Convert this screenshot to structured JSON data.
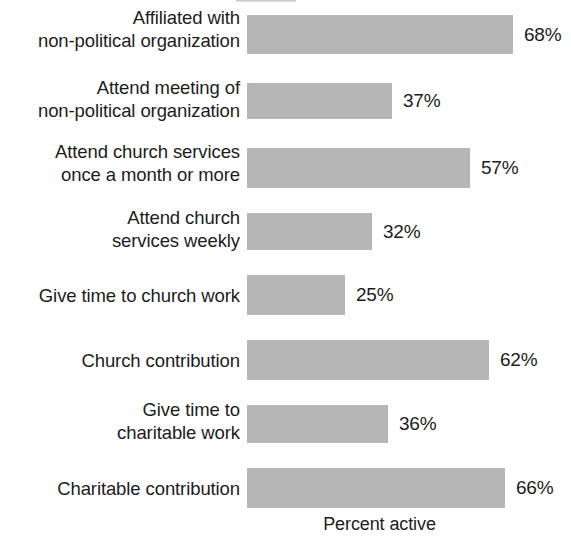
{
  "chart_data": {
    "type": "bar",
    "orientation": "horizontal",
    "title": "",
    "xlabel": "Percent active",
    "ylabel": "",
    "xlim": [
      0,
      100
    ],
    "grid": false,
    "legend": null,
    "bar_color": "#b6b6b6",
    "text_color": "#1c1c1c",
    "value_suffix": "%",
    "categories": [
      "Affiliated with\nnon-political organization",
      "Attend meeting of\nnon-political organization",
      "Attend church services\nonce a month or more",
      "Attend church\nservices weekly",
      "Give time to church work",
      "Church contribution",
      "Give time to\ncharitable work",
      "Charitable contribution"
    ],
    "values": [
      68,
      37,
      57,
      32,
      25,
      62,
      36,
      66
    ],
    "value_labels": [
      "68%",
      "37%",
      "57%",
      "32%",
      "25%",
      "62%",
      "36%",
      "66%"
    ]
  },
  "axis": {
    "caption": "Percent active"
  },
  "rows": [
    {
      "label": "Affiliated with\nnon-political organization",
      "value": 68,
      "value_label": "68%"
    },
    {
      "label": "Attend meeting of\nnon-political organization",
      "value": 37,
      "value_label": "37%"
    },
    {
      "label": "Attend church services\nonce a month or more",
      "value": 57,
      "value_label": "57%"
    },
    {
      "label": "Attend church\nservices weekly",
      "value": 32,
      "value_label": "32%"
    },
    {
      "label": "Give time to church work",
      "value": 25,
      "value_label": "25%"
    },
    {
      "label": "Church contribution",
      "value": 62,
      "value_label": "62%"
    },
    {
      "label": "Give time to\ncharitable work",
      "value": 36,
      "value_label": "36%"
    },
    {
      "label": "Charitable contribution",
      "value": 66,
      "value_label": "66%"
    }
  ]
}
